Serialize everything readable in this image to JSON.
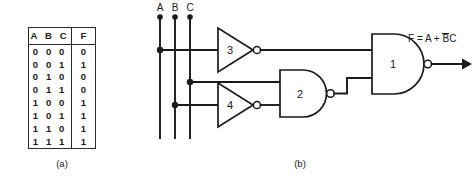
{
  "figure": {
    "caption_a": "(a)",
    "caption_b": "(b)"
  },
  "truth_table": {
    "headers": {
      "inputs": "A B C",
      "output": "F"
    },
    "rows": [
      {
        "inputs": "0 0 0",
        "output": "0"
      },
      {
        "inputs": "0 0 1",
        "output": "1"
      },
      {
        "inputs": "0 1 0",
        "output": "0"
      },
      {
        "inputs": "0 1 1",
        "output": "0"
      },
      {
        "inputs": "1 0 0",
        "output": "1"
      },
      {
        "inputs": "1 0 1",
        "output": "1"
      },
      {
        "inputs": "1 1 0",
        "output": "1"
      },
      {
        "inputs": "1 1 1",
        "output": "1"
      }
    ]
  },
  "circuit": {
    "input_labels": [
      "A",
      "B",
      "C"
    ],
    "gate_labels": {
      "nand1": "1",
      "nand2": "2",
      "inverter3": "3",
      "inverter4": "4"
    },
    "output_equation": {
      "prefix": "F = A + ",
      "overlined": "B",
      "suffix": "C"
    }
  },
  "colors": {
    "ink": "#1a1a1a",
    "background": "#ffffff",
    "rule": "#2b2b2b"
  }
}
